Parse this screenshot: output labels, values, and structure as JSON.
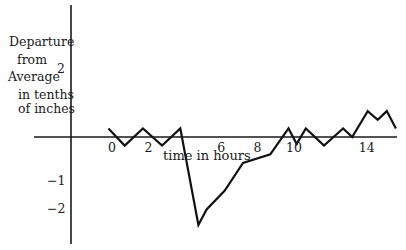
{
  "chart_data": {
    "type": "line",
    "title": "",
    "xlabel": "time in hours",
    "ylabel": "Departure from Average in tenths of inches",
    "ylabel_lines": [
      "Departure",
      "from",
      "Average",
      "in tenths",
      "of inches"
    ],
    "x_ticks": [
      {
        "value": 0,
        "label": "0"
      },
      {
        "value": 2,
        "label": "2"
      },
      {
        "value": 6,
        "label": "6"
      },
      {
        "value": 8,
        "label": "8"
      },
      {
        "value": 10,
        "label": "10"
      },
      {
        "value": 14,
        "label": "14"
      }
    ],
    "y_ticks": [
      {
        "value": 2,
        "label": "2"
      },
      {
        "value": -1,
        "label": "−1"
      },
      {
        "value": -2,
        "label": "−2"
      }
    ],
    "xlim": [
      -4,
      16
    ],
    "ylim": [
      -3.1,
      3.8
    ],
    "grid": false,
    "legend": null,
    "series": [
      {
        "name": "departure",
        "x": [
          -0.2,
          0.7,
          1.7,
          2.75,
          3.75,
          4.75,
          5.2,
          6.2,
          7.2,
          8.7,
          9.7,
          10.15,
          10.65,
          11.65,
          12.7,
          13.2,
          14.05,
          14.6,
          15.1,
          15.6
        ],
        "y": [
          0.25,
          -0.25,
          0.25,
          -0.25,
          0.25,
          -2.55,
          -2.1,
          -1.55,
          -0.75,
          -0.5,
          0.25,
          -0.2,
          0.25,
          -0.25,
          0.25,
          0.0,
          0.75,
          0.5,
          0.75,
          0.25
        ],
        "color": "#111111"
      }
    ]
  },
  "layout_px": {
    "origin_x": 112,
    "origin_y": 137,
    "px_per_hour": 18.2,
    "px_per_unit": 34.5,
    "x_axis": {
      "x1": 34,
      "x2": 397
    },
    "y_axis": {
      "x": 71,
      "y1": 5,
      "y2": 244
    },
    "y_tick_label_pos": [
      {
        "x": 57,
        "y": 62
      },
      {
        "x": 47,
        "y": 174
      },
      {
        "x": 47,
        "y": 202
      }
    ],
    "ylabel_pos": [
      {
        "x": 9,
        "y": 35
      },
      {
        "x": 17,
        "y": 53
      },
      {
        "x": 8,
        "y": 70
      },
      {
        "x": 18,
        "y": 88
      },
      {
        "x": 18,
        "y": 102
      }
    ],
    "xlabel_pos": {
      "x": 163,
      "y": 149
    },
    "x_tick_label_y": 141
  }
}
